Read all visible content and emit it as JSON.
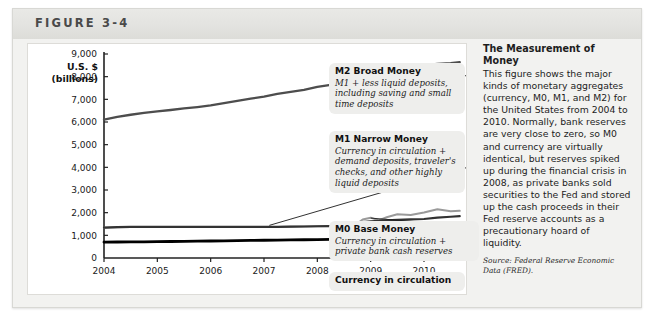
{
  "figure": {
    "label": "FIGURE 3-4"
  },
  "axis": {
    "y_title_line1": "U.S. $",
    "y_title_line2": "(billions)"
  },
  "callouts": [
    {
      "key": "m2",
      "title": "M2 Broad Money",
      "desc": "M1 + less liquid deposits, including saving and small time deposits"
    },
    {
      "key": "m1",
      "title": "M1 Narrow Money",
      "desc": "Currency in circulation + demand deposits, traveler's checks, and other highly liquid deposits"
    },
    {
      "key": "m0",
      "title": "M0 Base Money",
      "desc": "Currency in circulation + private bank cash reserves"
    },
    {
      "key": "currency",
      "title": "Currency in circulation",
      "desc": ""
    }
  ],
  "side": {
    "title": "The Measurement of Money",
    "body": "This figure shows the major kinds of monetary aggregates (currency, M0, M1, and M2) for the United States from 2004 to 2010. Normally, bank reserves are very close to zero, so M0 and currency are virtually identical, but reserves spiked up during the financial crisis in 2008, as private banks sold securities to the Fed and stored up the cash proceeds in their Fed reserve accounts as a precautionary hoard of liquidity.",
    "source": "Source: Federal Reserve Economic Data (FRED)."
  },
  "chart_data": {
    "type": "line",
    "title": "",
    "xlabel": "",
    "ylabel": "U.S. $ (billions)",
    "xlim": [
      2004,
      2010.75
    ],
    "ylim": [
      0,
      9000
    ],
    "yticks": [
      0,
      1000,
      2000,
      3000,
      4000,
      5000,
      6000,
      7000,
      8000,
      9000
    ],
    "ytick_labels": [
      "0",
      "1,000",
      "2,000",
      "3,000",
      "4,000",
      "5,000",
      "6,000",
      "7,000",
      "8,000",
      "9,000"
    ],
    "xticks": [
      2004,
      2005,
      2006,
      2007,
      2008,
      2009,
      2010
    ],
    "xtick_labels": [
      "2004",
      "2005",
      "2006",
      "2007",
      "2008",
      "2009",
      "2010"
    ],
    "grid": false,
    "legend": "callout-labels",
    "colors": {
      "m2": "#4d4d4d",
      "m1": "#333333",
      "m0": "#9a9a9a",
      "currency": "#000000"
    },
    "x": [
      2004.0,
      2004.25,
      2004.5,
      2004.75,
      2005.0,
      2005.25,
      2005.5,
      2005.75,
      2006.0,
      2006.25,
      2006.5,
      2006.75,
      2007.0,
      2007.25,
      2007.5,
      2007.75,
      2008.0,
      2008.25,
      2008.5,
      2008.7,
      2008.85,
      2009.0,
      2009.15,
      2009.3,
      2009.5,
      2009.75,
      2010.0,
      2010.25,
      2010.5,
      2010.67
    ],
    "series": [
      {
        "name": "M2 Broad Money",
        "key": "m2",
        "values": [
          6100,
          6230,
          6320,
          6400,
          6470,
          6530,
          6600,
          6660,
          6730,
          6830,
          6930,
          7030,
          7120,
          7240,
          7330,
          7420,
          7550,
          7640,
          7700,
          7800,
          8200,
          8380,
          8420,
          8470,
          8500,
          8520,
          8500,
          8560,
          8600,
          8640
        ]
      },
      {
        "name": "M1 Narrow Money",
        "key": "m1",
        "values": [
          1340,
          1360,
          1370,
          1370,
          1370,
          1370,
          1370,
          1370,
          1370,
          1370,
          1370,
          1370,
          1370,
          1370,
          1380,
          1390,
          1400,
          1410,
          1420,
          1450,
          1580,
          1620,
          1640,
          1660,
          1680,
          1700,
          1720,
          1780,
          1820,
          1850
        ]
      },
      {
        "name": "M0 Base Money",
        "key": "m0",
        "values": [
          1340,
          1360,
          1370,
          1370,
          1370,
          1370,
          1370,
          1370,
          1370,
          1370,
          1370,
          1370,
          1370,
          1370,
          1380,
          1390,
          1400,
          1410,
          1420,
          1430,
          1700,
          1780,
          1660,
          1800,
          1930,
          1900,
          2010,
          2150,
          2060,
          2080
        ]
      },
      {
        "name": "Currency in circulation",
        "key": "currency",
        "values": [
          700,
          705,
          710,
          715,
          720,
          728,
          735,
          742,
          750,
          758,
          766,
          774,
          782,
          790,
          798,
          806,
          814,
          822,
          830,
          845,
          860,
          880,
          895,
          905,
          915,
          930,
          950,
          975,
          995,
          1010
        ]
      }
    ]
  }
}
